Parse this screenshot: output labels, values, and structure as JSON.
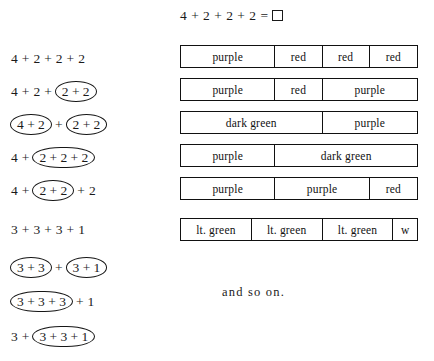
{
  "title_equation": {
    "tokens": [
      "4",
      "+",
      "2",
      "+",
      "2",
      "+",
      "2",
      "="
    ],
    "text": "4 + 2 + 2 + 2 =",
    "answer_box": ""
  },
  "expressions": [
    {
      "id": "expr-1",
      "text": "4 + 2 + 2 + 2",
      "top": 52,
      "parts": [
        {
          "type": "plain",
          "text": "4"
        },
        {
          "type": "plus",
          "text": "+"
        },
        {
          "type": "plain",
          "text": "2"
        },
        {
          "type": "plus",
          "text": "+"
        },
        {
          "type": "plain",
          "text": "2"
        },
        {
          "type": "plus",
          "text": "+"
        },
        {
          "type": "plain",
          "text": "2"
        }
      ]
    },
    {
      "id": "expr-2",
      "text": "4 + 2 + (2 + 2)",
      "top": 85,
      "parts": [
        {
          "type": "plain",
          "text": "4"
        },
        {
          "type": "plus",
          "text": "+"
        },
        {
          "type": "plain",
          "text": "2"
        },
        {
          "type": "plus",
          "text": "+"
        },
        {
          "type": "oval",
          "text": "2 + 2"
        }
      ]
    },
    {
      "id": "expr-3",
      "text": "(4 + 2) + (2 + 2)",
      "top": 118,
      "parts": [
        {
          "type": "oval",
          "text": "4 + 2"
        },
        {
          "type": "plus",
          "text": "+"
        },
        {
          "type": "oval",
          "text": "2 + 2"
        }
      ]
    },
    {
      "id": "expr-4",
      "text": "4 + (2 + 2 + 2)",
      "top": 151,
      "parts": [
        {
          "type": "plain",
          "text": "4"
        },
        {
          "type": "plus",
          "text": "+"
        },
        {
          "type": "oval-wide",
          "text": "2 + 2 + 2"
        }
      ]
    },
    {
      "id": "expr-5",
      "text": "4 + (2 + 2) + 2",
      "top": 184,
      "parts": [
        {
          "type": "plain",
          "text": "4"
        },
        {
          "type": "plus",
          "text": "+"
        },
        {
          "type": "oval",
          "text": "2 + 2"
        },
        {
          "type": "plus",
          "text": "+"
        },
        {
          "type": "plain",
          "text": "2"
        }
      ]
    },
    {
      "id": "expr-6",
      "text": "3 + 3 + 3 + 1",
      "top": 223,
      "parts": [
        {
          "type": "plain",
          "text": "3"
        },
        {
          "type": "plus",
          "text": "+"
        },
        {
          "type": "plain",
          "text": "3"
        },
        {
          "type": "plus",
          "text": "+"
        },
        {
          "type": "plain",
          "text": "3"
        },
        {
          "type": "plus",
          "text": "+"
        },
        {
          "type": "plain",
          "text": "1"
        }
      ]
    },
    {
      "id": "expr-7",
      "text": "(3 + 3) + (3 + 1)",
      "top": 261,
      "parts": [
        {
          "type": "oval",
          "text": "3 + 3"
        },
        {
          "type": "plus",
          "text": "+"
        },
        {
          "type": "oval",
          "text": "3 + 1"
        }
      ]
    },
    {
      "id": "expr-8",
      "text": "(3 + 3 + 3) + 1",
      "top": 295,
      "parts": [
        {
          "type": "oval-wide",
          "text": "3 + 3 + 3"
        },
        {
          "type": "plus",
          "text": "+"
        },
        {
          "type": "plain",
          "text": "1"
        }
      ]
    },
    {
      "id": "expr-9",
      "text": "3 + (3 + 3 + 1)",
      "top": 330,
      "parts": [
        {
          "type": "plain",
          "text": "3"
        },
        {
          "type": "plus",
          "text": "+"
        },
        {
          "type": "oval-wide",
          "text": "3 + 3 + 1"
        }
      ]
    }
  ],
  "bars": [
    {
      "id": "bar-1",
      "top": 45,
      "width": 238,
      "cells": [
        {
          "label": "purple",
          "units": 4
        },
        {
          "label": "red",
          "units": 2
        },
        {
          "label": "red",
          "units": 2
        },
        {
          "label": "red",
          "units": 2
        }
      ]
    },
    {
      "id": "bar-2",
      "top": 78,
      "width": 238,
      "cells": [
        {
          "label": "purple",
          "units": 4
        },
        {
          "label": "red",
          "units": 2
        },
        {
          "label": "purple",
          "units": 4
        }
      ]
    },
    {
      "id": "bar-3",
      "top": 111,
      "width": 238,
      "cells": [
        {
          "label": "dark green",
          "units": 6
        },
        {
          "label": "purple",
          "units": 4
        }
      ]
    },
    {
      "id": "bar-4",
      "top": 144,
      "width": 238,
      "cells": [
        {
          "label": "purple",
          "units": 4
        },
        {
          "label": "dark green",
          "units": 6
        }
      ]
    },
    {
      "id": "bar-5",
      "top": 177,
      "width": 238,
      "cells": [
        {
          "label": "purple",
          "units": 4
        },
        {
          "label": "purple",
          "units": 4
        },
        {
          "label": "red",
          "units": 2
        }
      ]
    },
    {
      "id": "bar-6",
      "top": 218,
      "width": 238,
      "cells": [
        {
          "label": "lt. green",
          "units": 3
        },
        {
          "label": "lt. green",
          "units": 3
        },
        {
          "label": "lt. green",
          "units": 3
        },
        {
          "label": "w",
          "units": 1
        }
      ]
    }
  ],
  "footer": {
    "and_so_on": "and  so  on."
  }
}
